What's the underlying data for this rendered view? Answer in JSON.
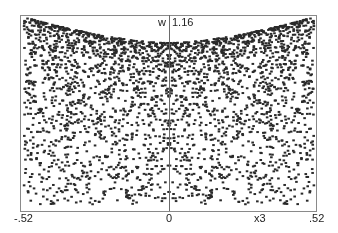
{
  "chart_data": {
    "type": "scatter",
    "title": "",
    "xlabel": "x3",
    "ylabel": "w",
    "xlim": [
      -0.52,
      0.52
    ],
    "ylim_top_label": "1.16",
    "x_tick_labels": [
      "-.52",
      "0",
      ".52"
    ],
    "y_tick_labels": [
      "1.16"
    ],
    "grid": false,
    "legend": null,
    "point_color": "#2a2a2a",
    "frame_color": "#8a8a8a",
    "axis_color": "#6a6a6a",
    "approx_point_count": 3200
  },
  "labels": {
    "y_axis_name": "w",
    "y_max": "1.16",
    "x_min": "-.52",
    "x_zero": "0",
    "x_axis_name": "x3",
    "x_max": ".52"
  }
}
